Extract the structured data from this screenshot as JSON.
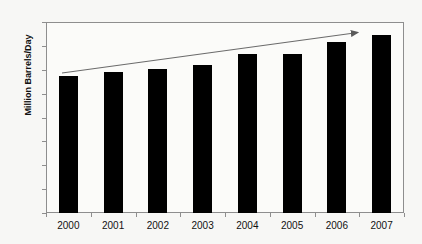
{
  "chart_data": {
    "type": "bar",
    "title": "",
    "subtitle": "",
    "xlabel": "",
    "ylabel": "Million Barrels/Day",
    "categories": [
      "2000",
      "2001",
      "2002",
      "2003",
      "2004",
      "2005",
      "2006",
      "2007"
    ],
    "values": [
      28.7,
      29.5,
      30.1,
      31.0,
      33.2,
      33.4,
      35.8,
      37.2
    ],
    "series": [
      {
        "name": "World Oil Demand",
        "values": [
          28.7,
          29.5,
          30.1,
          31.0,
          33.2,
          33.4,
          35.8,
          37.2
        ]
      }
    ],
    "ylim": [
      0,
      40
    ],
    "ytick_step": 5,
    "yticks": [
      "40",
      "35",
      "30",
      "25",
      "20",
      "15",
      "10",
      "5",
      "0"
    ],
    "ytick_values": [
      40,
      35,
      30,
      25,
      20,
      15,
      10,
      5,
      0
    ],
    "grid": false,
    "legend": false,
    "legend_position": "none",
    "bar_color": "#000000",
    "plot_background": "#fbfbf9",
    "figure_background": "#f7f7f5",
    "axis_color": "#8e8e8e",
    "annotations": [
      {
        "type": "arrow",
        "label": "upward trend arrow",
        "color": "#6b6b6b",
        "start": {
          "x": 62,
          "y": 73
        },
        "end": {
          "x": 362,
          "y": 32
        }
      }
    ]
  }
}
